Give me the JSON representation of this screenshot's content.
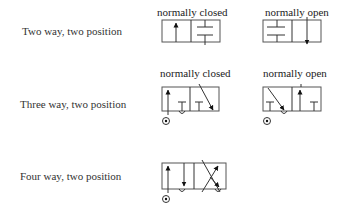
{
  "rows": [
    {
      "label": "Two way, two position"
    },
    {
      "label": "Three way, two position"
    },
    {
      "label": "Four way, two position"
    }
  ],
  "captions": {
    "two_way_closed": "normally closed",
    "two_way_open": "normally open",
    "three_way_closed": "normally closed",
    "three_way_open": "normally open"
  },
  "colors": {
    "line": "#333333",
    "background": "#ffffff"
  }
}
